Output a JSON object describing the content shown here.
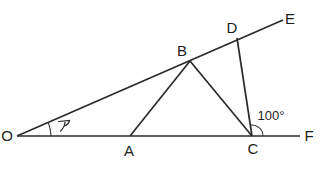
{
  "figure": {
    "type": "geometry-diagram",
    "background": "#ffffff",
    "stroke_color": "#2a2a2a",
    "text_color": "#1e1e1e",
    "width": 321,
    "height": 171,
    "points": {
      "O": {
        "x": 17,
        "y": 136,
        "label": "O",
        "lx": 7,
        "ly": 141
      },
      "A": {
        "x": 130,
        "y": 136,
        "label": "A",
        "lx": 129,
        "ly": 156
      },
      "B": {
        "x": 190,
        "y": 61,
        "label": "B",
        "lx": 182,
        "ly": 56
      },
      "C": {
        "x": 252,
        "y": 136,
        "label": "C",
        "lx": 253,
        "ly": 154
      },
      "D": {
        "x": 237,
        "y": 38,
        "label": "D",
        "lx": 232,
        "ly": 33
      },
      "E": {
        "x": 283,
        "y": 20,
        "label": "E",
        "lx": 290,
        "ly": 24
      },
      "F": {
        "x": 300,
        "y": 136,
        "label": "F",
        "lx": 309,
        "ly": 141
      }
    },
    "segments": [
      {
        "from": "O",
        "to": "E",
        "name": "ray-OE"
      },
      {
        "from": "O",
        "to": "F",
        "name": "ray-OF"
      },
      {
        "from": "A",
        "to": "B",
        "name": "segment-AB"
      },
      {
        "from": "B",
        "to": "C",
        "name": "segment-BC"
      },
      {
        "from": "D",
        "to": "C",
        "name": "segment-DC"
      }
    ],
    "angle_marks": [
      {
        "vertex": "O",
        "ray1": "F",
        "ray2": "E",
        "radius": 34,
        "label": "ア",
        "label_kind": "glyph",
        "lx": 64,
        "ly": 126,
        "font_size": 11,
        "name": "angle-a-at-O"
      },
      {
        "vertex": "C",
        "ray1": "F",
        "ray2": "D",
        "radius": 11,
        "label": "100°",
        "label_kind": "text",
        "lx": 271,
        "ly": 120,
        "font_size": 13,
        "name": "angle-100-at-C"
      }
    ]
  }
}
